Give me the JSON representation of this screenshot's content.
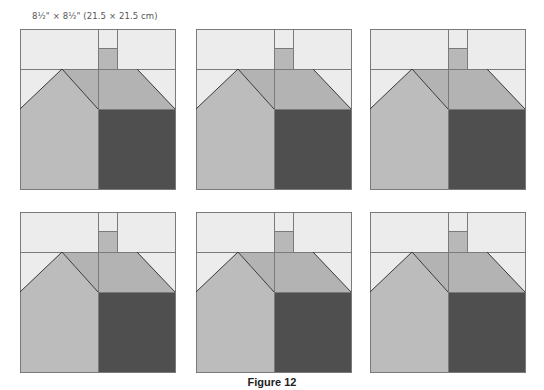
{
  "size_label": "8½\" × 8½\" (21.5 × 21.5 cm)",
  "caption": "Figure 12",
  "colors": {
    "background": "#ececec",
    "roof": "#b3b3b3",
    "house_front": "#bcbcbc",
    "dark_wall": "#4f4f4f",
    "chimney": "#b8b8b8",
    "seam": "#7a7a7a"
  },
  "blocks": [
    {
      "id": 1,
      "row": 1,
      "col": 1
    },
    {
      "id": 2,
      "row": 1,
      "col": 2
    },
    {
      "id": 3,
      "row": 1,
      "col": 3
    },
    {
      "id": 4,
      "row": 2,
      "col": 1
    },
    {
      "id": 5,
      "row": 2,
      "col": 2
    },
    {
      "id": 6,
      "row": 2,
      "col": 3
    }
  ]
}
